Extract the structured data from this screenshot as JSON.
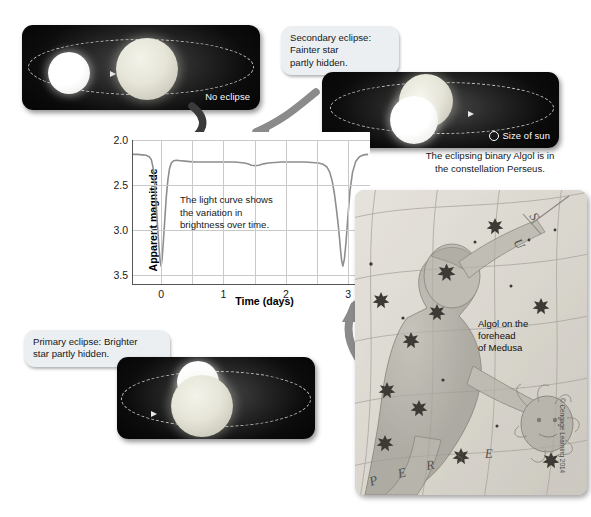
{
  "figure": {
    "copyright": "© Cengage Learning 2014"
  },
  "panels": {
    "no_eclipse": {
      "label": "No eclipse"
    },
    "secondary_eclipse": {
      "callout": "Secondary eclipse:\nFainter star\npartly hidden.",
      "callout_lines": [
        "Secondary eclipse:",
        "Fainter star",
        "partly hidden."
      ],
      "sun_reference": "Size of sun"
    },
    "primary_eclipse": {
      "callout_lines": [
        "Primary eclipse: Brighter",
        "star partly hidden."
      ]
    }
  },
  "chart_note_lines": [
    "The light curve shows",
    "the variation in",
    "brightness over time."
  ],
  "star_map": {
    "caption_lines": [
      "The eclipsing binary Algol is in",
      "the constellation Perseus."
    ],
    "annotation_lines": [
      "Algol on the",
      "forehead",
      "of Medusa"
    ],
    "constellation_letters": [
      "P",
      "E",
      "R",
      "S",
      "E",
      "U",
      "S"
    ]
  },
  "chart_data": {
    "type": "line",
    "title": "",
    "xlabel": "Time (days)",
    "ylabel": "Apparent magnitude",
    "xlim": [
      -0.45,
      3.35
    ],
    "ylim": [
      2.0,
      3.6
    ],
    "y_inverted": true,
    "xticks": [
      "0",
      "1",
      "2",
      "3"
    ],
    "xtick_values": [
      0,
      1,
      2,
      3
    ],
    "yticks": [
      "2.0",
      "2.5",
      "3.0",
      "3.5"
    ],
    "ytick_values": [
      2.0,
      2.5,
      3.0,
      3.5
    ],
    "grid": true,
    "legend": "none",
    "series": [
      {
        "name": "Algol light curve",
        "color": "#8e8e8e",
        "x": [
          -0.45,
          -0.38,
          -0.3,
          -0.24,
          -0.19,
          -0.155,
          -0.13,
          -0.105,
          -0.085,
          -0.06,
          -0.035,
          -0.015,
          0.0,
          0.015,
          0.035,
          0.06,
          0.085,
          0.11,
          0.135,
          0.165,
          0.2,
          0.25,
          0.31,
          0.38,
          0.46,
          0.56,
          0.68,
          0.82,
          0.95,
          1.08,
          1.18,
          1.26,
          1.33,
          1.39,
          1.45,
          1.51,
          1.57,
          1.64,
          1.72,
          1.82,
          1.94,
          2.06,
          2.18,
          2.3,
          2.42,
          2.52,
          2.6,
          2.66,
          2.705,
          2.745,
          2.78,
          2.81,
          2.84,
          2.865,
          2.88,
          2.895,
          2.915,
          2.94,
          2.965,
          2.995,
          3.03,
          3.07,
          3.12,
          3.18,
          3.25,
          3.32
        ],
        "y": [
          2.16,
          2.16,
          2.165,
          2.17,
          2.185,
          2.22,
          2.3,
          2.46,
          2.66,
          2.92,
          3.18,
          3.34,
          3.4,
          3.33,
          3.15,
          2.88,
          2.62,
          2.44,
          2.32,
          2.255,
          2.23,
          2.225,
          2.23,
          2.235,
          2.24,
          2.245,
          2.245,
          2.245,
          2.245,
          2.245,
          2.245,
          2.25,
          2.255,
          2.265,
          2.28,
          2.285,
          2.28,
          2.265,
          2.255,
          2.25,
          2.245,
          2.245,
          2.245,
          2.245,
          2.25,
          2.255,
          2.27,
          2.3,
          2.36,
          2.46,
          2.6,
          2.76,
          2.94,
          3.12,
          3.24,
          3.34,
          3.4,
          3.32,
          3.14,
          2.86,
          2.56,
          2.36,
          2.24,
          2.185,
          2.165,
          2.16
        ]
      }
    ],
    "features": [
      {
        "name": "primary minimum",
        "time_days": 0.0,
        "magnitude": 3.4
      },
      {
        "name": "secondary minimum",
        "time_days": 1.45,
        "magnitude": 2.28
      },
      {
        "name": "primary minimum",
        "time_days": 2.87,
        "magnitude": 3.4
      },
      {
        "name": "out-of-eclipse",
        "time_days": null,
        "magnitude": 2.16
      }
    ]
  }
}
